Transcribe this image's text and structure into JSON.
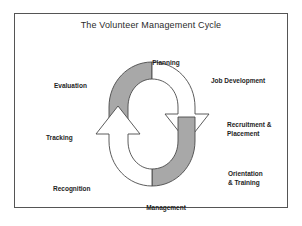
{
  "diagram": {
    "title": "The Volunteer Management Cycle",
    "type": "cycle-diagram",
    "frame": {
      "border_color": "#555555",
      "background": "#ffffff"
    },
    "graphic": {
      "name": "circular-two-arrow-cycle",
      "band_fill": "#a8a8a8",
      "arrow_fill": "#ffffff",
      "stroke": "#4a4a4a",
      "direction": "clockwise",
      "arrowheads": 2
    },
    "stages": [
      {
        "id": "planning",
        "label": "Planning",
        "position": "top-center"
      },
      {
        "id": "job-development",
        "label": "Job Development",
        "position": "top-right"
      },
      {
        "id": "recruitment",
        "line1": "Recruitment &",
        "line2": "Placement",
        "position": "right"
      },
      {
        "id": "orientation",
        "line1": "Orientation",
        "line2": "& Training",
        "position": "bottom-right"
      },
      {
        "id": "management",
        "label": "Management",
        "position": "bottom-center"
      },
      {
        "id": "recognition",
        "label": "Recognition",
        "position": "bottom-left"
      },
      {
        "id": "tracking",
        "label": "Tracking",
        "position": "left"
      },
      {
        "id": "evaluation",
        "label": "Evaluation",
        "position": "top-left"
      }
    ]
  }
}
